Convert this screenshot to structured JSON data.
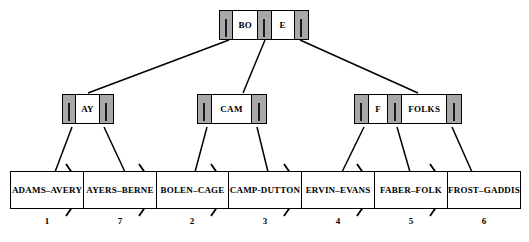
{
  "diagram": {
    "type": "b-plus-tree",
    "colors": {
      "pointer_cell": "#a8a8a8",
      "key_cell": "#ffffff",
      "stroke": "#000000",
      "background": "#ffffff"
    },
    "root": {
      "name": "root-node",
      "cells": [
        {
          "kind": "pointer",
          "label": ""
        },
        {
          "kind": "key",
          "label": "BO"
        },
        {
          "kind": "pointer",
          "label": ""
        },
        {
          "kind": "key",
          "label": "E"
        },
        {
          "kind": "pointer",
          "label": ""
        }
      ]
    },
    "internal_nodes": [
      {
        "name": "internal-node-left",
        "cells": [
          {
            "kind": "pointer",
            "label": ""
          },
          {
            "kind": "key",
            "label": "AY"
          },
          {
            "kind": "pointer",
            "label": ""
          }
        ]
      },
      {
        "name": "internal-node-center",
        "cells": [
          {
            "kind": "pointer",
            "label": ""
          },
          {
            "kind": "key",
            "label": "CAM"
          },
          {
            "kind": "pointer",
            "label": ""
          }
        ]
      },
      {
        "name": "internal-node-right",
        "cells": [
          {
            "kind": "pointer",
            "label": ""
          },
          {
            "kind": "key",
            "label": "F"
          },
          {
            "kind": "pointer",
            "label": ""
          },
          {
            "kind": "key",
            "label": "FOLKS"
          },
          {
            "kind": "pointer",
            "label": ""
          }
        ]
      }
    ],
    "leaves": [
      {
        "label": "ADAMS–AVERY",
        "number": "1"
      },
      {
        "label": "AYERS–BERNE",
        "number": "7"
      },
      {
        "label": "BOLEN–CAGE",
        "number": "2"
      },
      {
        "label": "CAMP-DUTTON",
        "number": "3"
      },
      {
        "label": "ERVIN–EVANS",
        "number": "4"
      },
      {
        "label": "FABER–FOLK",
        "number": "5"
      },
      {
        "label": "FROST–GADDIS",
        "number": "6"
      }
    ]
  }
}
